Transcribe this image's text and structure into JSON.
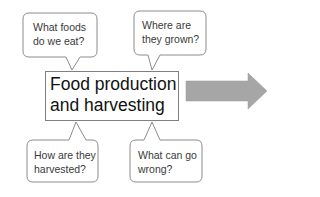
{
  "diagram": {
    "main_box": {
      "line1": "Food production",
      "line2": "and harvesting"
    },
    "bubbles": [
      {
        "id": "what-foods",
        "line1": "What foods",
        "line2": "do we eat?"
      },
      {
        "id": "where-grown",
        "line1": "Where are",
        "line2": "they grown?"
      },
      {
        "id": "how-harvested",
        "line1": "How are they",
        "line2": "harvested?"
      },
      {
        "id": "what-wrong",
        "line1": "What can go",
        "line2": "wrong?"
      }
    ],
    "arrow": {
      "direction": "right",
      "color": "#a6a6a6"
    },
    "colors": {
      "stroke": "#8c8c8c",
      "box_stroke": "#7f7f7f",
      "fill": "#ffffff"
    }
  }
}
